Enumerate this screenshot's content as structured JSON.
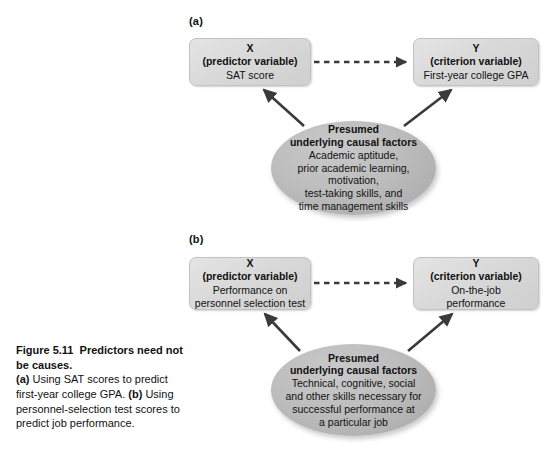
{
  "figure": {
    "panel_a_label": "(a)",
    "panel_b_label": "(b)"
  },
  "panel_a": {
    "predictor_box": {
      "line1": "X",
      "line2": "(predictor variable)",
      "line3": "SAT score"
    },
    "criterion_box": {
      "line1": "Y",
      "line2": "(criterion variable)",
      "line3": "First-year college GPA"
    },
    "causal_ellipse": {
      "line1": "Presumed",
      "line2": "underlying causal factors",
      "line3": "Academic aptitude,",
      "line4": "prior academic learning,",
      "line5": "motivation,",
      "line6": "test-taking skills, and",
      "line7": "time management skills"
    }
  },
  "panel_b": {
    "predictor_box": {
      "line1": "X",
      "line2": "(predictor variable)",
      "line3": "Performance on",
      "line4": "personnel selection test"
    },
    "criterion_box": {
      "line1": "Y",
      "line2": "(criterion variable)",
      "line3": "On-the-job",
      "line4": "performance"
    },
    "causal_ellipse": {
      "line1": "Presumed",
      "line2": "underlying causal factors",
      "line3": "Technical, cognitive, social",
      "line4": "and other skills necessary for",
      "line5": "successful performance at",
      "line6": "a particular job"
    }
  },
  "caption": {
    "figure_number": "Figure 5.11",
    "title": "Predictors need not be causes.",
    "a_marker": "(a)",
    "a_text": "Using SAT scores to predict first-year college GPA.",
    "b_marker": "(b)",
    "b_text": "Using personnel-selection test scores to predict job performance."
  },
  "colors": {
    "box_fill": "#d9d9d9",
    "ellipse_fill": "#b8b8b8",
    "arrow": "#3a3a3a",
    "text": "#111111",
    "background": "#ffffff"
  }
}
